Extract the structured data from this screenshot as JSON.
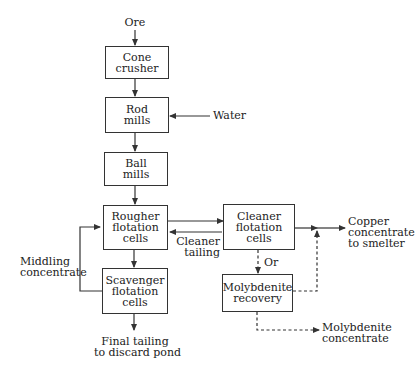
{
  "diagram": {
    "type": "process-flow",
    "inputs": {
      "ore": "Ore",
      "water": "Water"
    },
    "nodes": [
      {
        "id": "cone_crusher",
        "label": "Cone\ncrusher"
      },
      {
        "id": "rod_mills",
        "label": "Rod\nmills"
      },
      {
        "id": "ball_mills",
        "label": "Ball\nmills"
      },
      {
        "id": "rougher",
        "label": "Rougher\nflotation\ncells"
      },
      {
        "id": "scavenger",
        "label": "Scavenger\nflotation\ncells"
      },
      {
        "id": "cleaner",
        "label": "Cleaner\nflotation\ncells"
      },
      {
        "id": "moly",
        "label": "Molybdenite\nrecovery"
      }
    ],
    "edge_labels": {
      "cleaner_tailing": "Cleaner\ntailing",
      "middling": "Middling\nconcentrate",
      "or": "Or",
      "copper": "Copper\nconcentrate\nto smelter",
      "moly_conc": "Molybdenite\nconcentrate",
      "final_tailing": "Final tailing\nto discard pond"
    },
    "edges": [
      {
        "from": "Ore",
        "to": "cone_crusher",
        "style": "solid"
      },
      {
        "from": "cone_crusher",
        "to": "rod_mills",
        "style": "solid"
      },
      {
        "from": "Water",
        "to": "rod_mills",
        "style": "solid"
      },
      {
        "from": "rod_mills",
        "to": "ball_mills",
        "style": "solid"
      },
      {
        "from": "ball_mills",
        "to": "rougher",
        "style": "solid"
      },
      {
        "from": "rougher",
        "to": "cleaner",
        "style": "solid"
      },
      {
        "from": "cleaner",
        "to": "rougher",
        "label": "Cleaner tailing",
        "style": "solid"
      },
      {
        "from": "rougher",
        "to": "scavenger",
        "style": "solid"
      },
      {
        "from": "scavenger",
        "to": "rougher",
        "label": "Middling concentrate",
        "style": "solid"
      },
      {
        "from": "scavenger",
        "to": "Final tailing to discard pond",
        "style": "solid"
      },
      {
        "from": "cleaner",
        "to": "Copper concentrate to smelter",
        "style": "solid"
      },
      {
        "from": "cleaner",
        "to": "moly",
        "label": "Or",
        "style": "dashed"
      },
      {
        "from": "moly",
        "to": "Copper concentrate to smelter",
        "style": "dashed"
      },
      {
        "from": "moly",
        "to": "Molybdenite concentrate",
        "style": "dashed"
      }
    ]
  }
}
